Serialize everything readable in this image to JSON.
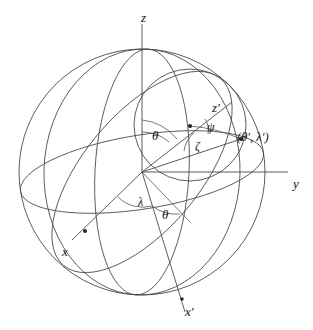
{
  "figure": {
    "type": "geometry-diagram",
    "background_color": "#ffffff",
    "line_color": "#4a4a4a",
    "point_color": "#222222"
  },
  "sphere": {
    "center": {
      "x": 142,
      "y": 172
    },
    "radius": 123
  },
  "small_circle": {
    "center": {
      "x": 190,
      "y": 125
    },
    "radius": 56
  },
  "axes": [
    {
      "name": "z-axis",
      "label": "z",
      "label_x": 141,
      "label_y": 11,
      "tip_x": 142,
      "tip_y": 24,
      "origin_x": 142,
      "origin_y": 172
    },
    {
      "name": "y-axis",
      "label": "y",
      "label_x": 293,
      "label_y": 177,
      "tip_x": 288,
      "tip_y": 172,
      "origin_x": 142,
      "origin_y": 172
    },
    {
      "name": "x-axis",
      "label": "x",
      "label_x": 62,
      "label_y": 245,
      "tip_x": 85,
      "tip_y": 231,
      "origin_x": 142,
      "origin_y": 172
    },
    {
      "name": "x-prime-axis",
      "label": "x′",
      "label_x": 185,
      "label_y": 305,
      "tip_x": 182,
      "tip_y": 299,
      "origin_x": 142,
      "origin_y": 172
    },
    {
      "name": "z-prime-axis",
      "label": "z′",
      "label_x": 212,
      "label_y": 101,
      "tip_x": 190,
      "tip_y": 126,
      "origin_x": 142,
      "origin_y": 172
    }
  ],
  "angle_labels": [
    {
      "name": "theta-upper",
      "text": "θ",
      "x": 152,
      "y": 129,
      "size": 13
    },
    {
      "name": "theta-lower",
      "text": "θ",
      "x": 162,
      "y": 208,
      "size": 13
    },
    {
      "name": "lambda",
      "text": "λ",
      "x": 138,
      "y": 196,
      "size": 12
    },
    {
      "name": "psi",
      "text": "ψ",
      "x": 207,
      "y": 121,
      "size": 12
    },
    {
      "name": "zeta",
      "text": "ζ",
      "x": 195,
      "y": 140,
      "size": 12
    }
  ],
  "points": [
    {
      "name": "z-prime-pole-point",
      "x": 190,
      "y": 126,
      "r": 2.1
    },
    {
      "name": "target-point",
      "x": 241,
      "y": 139,
      "r": 2.1
    },
    {
      "name": "x-axis-point",
      "x": 85,
      "y": 231,
      "r": 2.0
    },
    {
      "name": "x-prime-axis-point",
      "x": 182,
      "y": 299,
      "r": 1.8
    }
  ],
  "point_label": {
    "name": "theta-prime-lambda-prime",
    "text": "(θ′, λ′)",
    "x": 237,
    "y": 131
  }
}
